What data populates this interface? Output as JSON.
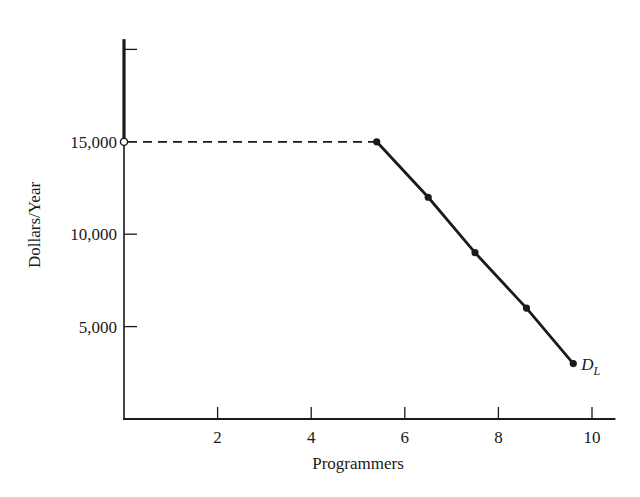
{
  "chart_data": {
    "type": "line",
    "title": "",
    "xlabel": "Programmers",
    "ylabel": "Dollars/Year",
    "xlim": [
      0,
      10.5
    ],
    "ylim": [
      0,
      20500
    ],
    "grid": false,
    "legend": "none",
    "x_ticks": [
      2,
      4,
      6,
      8,
      10
    ],
    "x_tick_labels": [
      "2",
      "4",
      "6",
      "8",
      "10"
    ],
    "y_ticks": [
      5000,
      10000,
      15000,
      20000
    ],
    "y_tick_labels": [
      "5,000",
      "10,000",
      "15,000",
      ""
    ],
    "series": [
      {
        "name": "D_L",
        "label_main": "D",
        "label_sub": "L",
        "style": "solid",
        "markers": "filled-dot",
        "x": [
          5.4,
          6.5,
          7.5,
          8.6,
          9.6
        ],
        "y": [
          15000,
          12000,
          9000,
          6000,
          3000
        ]
      }
    ],
    "annotations": [
      {
        "type": "dashed-horizontal-line",
        "from_x": 0,
        "to_x": 5.4,
        "y": 15000
      },
      {
        "type": "open-circle",
        "x": 0,
        "y": 15000
      },
      {
        "type": "thick-vertical-segment",
        "x": 0,
        "from_y": 15000,
        "to_y": 20500
      }
    ]
  },
  "colors": {
    "ink": "#1a1a1a",
    "background": "#ffffff"
  }
}
